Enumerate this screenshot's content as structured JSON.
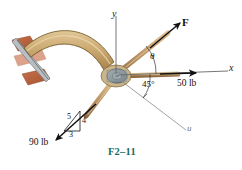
{
  "figure": {
    "caption": "F2–11",
    "caption_color": "#1d6b5f",
    "background": "#ffffff"
  },
  "axes": [
    {
      "name": "y-axis",
      "label": "y",
      "direction": "vertical-up",
      "color": "#555555"
    },
    {
      "name": "x-axis",
      "label": "x",
      "direction": "horizontal-right",
      "color": "#555555"
    },
    {
      "name": "u-axis",
      "label": "u",
      "direction": "down-right-45deg",
      "color": "#8a8a8a"
    }
  ],
  "forces": [
    {
      "name": "force-F",
      "label": "F",
      "magnitude": null,
      "unit": null,
      "direction": "up-right",
      "color": "#111111"
    },
    {
      "name": "force-50",
      "label": "50 lb",
      "magnitude": 50,
      "unit": "lb",
      "direction": "along-positive-x",
      "color": "#111111"
    },
    {
      "name": "force-90",
      "label": "90 lb",
      "magnitude": 90,
      "unit": "lb",
      "direction": "down-left",
      "color": "#111111"
    }
  ],
  "angles": [
    {
      "name": "angle-theta",
      "label": "θ",
      "between": "x-axis and F",
      "value": null
    },
    {
      "name": "angle-45",
      "label": "45°",
      "between": "x-axis and u-axis",
      "value": 45
    }
  ],
  "slope_triangle": {
    "name": "slope-triangle-3-4-5",
    "hypotenuse": "5",
    "vertical": "4",
    "horizontal": "3"
  },
  "structure": {
    "bracket_arm": {
      "name": "curved-bracket-arm",
      "color": "#cdab74",
      "outline": "#6b5526"
    },
    "wall_mount": {
      "name": "wall-mount-plate",
      "color": "#b5603f"
    },
    "hub": {
      "name": "pivot-hub",
      "color": "#8d9aa0"
    },
    "rods": {
      "name": "force-rods",
      "color": "#c19a6b"
    }
  },
  "colors": {
    "tan": "#cdab74",
    "rust": "#b5603f",
    "steel": "#8d9aa0",
    "rod": "#c19a6b",
    "ink": "#111111",
    "axis_gray": "#666666",
    "caption_teal": "#1d6b5f"
  }
}
